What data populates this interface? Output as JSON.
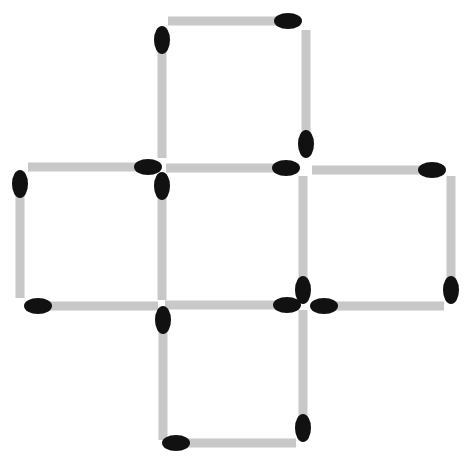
{
  "diagram": {
    "type": "matchstick-puzzle",
    "shape": "cross of five squares",
    "stick_color": "#c8c8c8",
    "head_color": "#111111",
    "background": "#ffffff",
    "stick_thickness": 9,
    "head_rx": 14,
    "head_ry": 8,
    "matches": [
      {
        "id": 1,
        "orientation": "h",
        "x1": 168,
        "y1": 21,
        "x2": 300,
        "y2": 21,
        "head": "end"
      },
      {
        "id": 2,
        "orientation": "v",
        "x1": 162,
        "y1": 28,
        "x2": 162,
        "y2": 158,
        "head": "start"
      },
      {
        "id": 3,
        "orientation": "v",
        "x1": 306,
        "y1": 30,
        "x2": 306,
        "y2": 156,
        "head": "end"
      },
      {
        "id": 4,
        "orientation": "h",
        "x1": 28,
        "y1": 167,
        "x2": 160,
        "y2": 167,
        "head": "end"
      },
      {
        "id": 5,
        "orientation": "h",
        "x1": 166,
        "y1": 168,
        "x2": 298,
        "y2": 168,
        "head": "end"
      },
      {
        "id": 6,
        "orientation": "h",
        "x1": 312,
        "y1": 170,
        "x2": 444,
        "y2": 170,
        "head": "end"
      },
      {
        "id": 7,
        "orientation": "v",
        "x1": 20,
        "y1": 172,
        "x2": 20,
        "y2": 298,
        "head": "start"
      },
      {
        "id": 8,
        "orientation": "v",
        "x1": 162,
        "y1": 174,
        "x2": 162,
        "y2": 300,
        "head": "start"
      },
      {
        "id": 9,
        "orientation": "v",
        "x1": 303,
        "y1": 176,
        "x2": 303,
        "y2": 302,
        "head": "end"
      },
      {
        "id": 10,
        "orientation": "v",
        "x1": 451,
        "y1": 176,
        "x2": 451,
        "y2": 302,
        "head": "end"
      },
      {
        "id": 11,
        "orientation": "h",
        "x1": 26,
        "y1": 306,
        "x2": 158,
        "y2": 306,
        "head": "start"
      },
      {
        "id": 12,
        "orientation": "h",
        "x1": 165,
        "y1": 305,
        "x2": 299,
        "y2": 305,
        "head": "end"
      },
      {
        "id": 13,
        "orientation": "h",
        "x1": 312,
        "y1": 306,
        "x2": 444,
        "y2": 306,
        "head": "start"
      },
      {
        "id": 14,
        "orientation": "v",
        "x1": 163,
        "y1": 308,
        "x2": 163,
        "y2": 440,
        "head": "start"
      },
      {
        "id": 15,
        "orientation": "v",
        "x1": 303,
        "y1": 310,
        "x2": 303,
        "y2": 440,
        "head": "end"
      },
      {
        "id": 16,
        "orientation": "h",
        "x1": 164,
        "y1": 443,
        "x2": 296,
        "y2": 443,
        "head": "start"
      }
    ]
  }
}
